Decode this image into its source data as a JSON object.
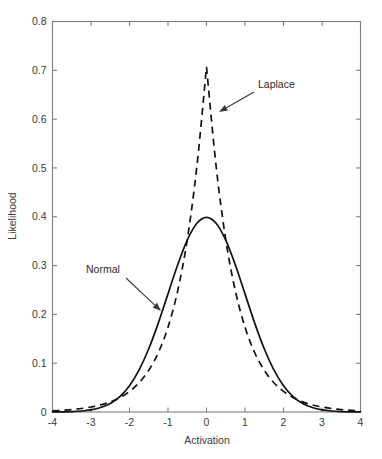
{
  "chart_data": {
    "type": "line",
    "title": "",
    "xlabel": "Activation",
    "ylabel": "Likelihood",
    "xlim": [
      -4,
      4
    ],
    "ylim": [
      0,
      0.8
    ],
    "xticks": [
      "-4",
      "-3",
      "-2",
      "-1",
      "0",
      "1",
      "2",
      "3",
      "4"
    ],
    "xtick_values": [
      -4,
      -3,
      -2,
      -1,
      0,
      1,
      2,
      3,
      4
    ],
    "yticks": [
      "0",
      "0.1",
      "0.2",
      "0.3",
      "0.4",
      "0.5",
      "0.6",
      "0.7",
      "0.8"
    ],
    "ytick_values": [
      0,
      0.1,
      0.2,
      0.3,
      0.4,
      0.5,
      0.6,
      0.7,
      0.8
    ],
    "grid": false,
    "legend_position": "inline-annotations",
    "series": [
      {
        "name": "Normal",
        "style": "solid",
        "color": "#111111",
        "description": "Standard normal density, mean 0, sd 1",
        "x": [
          -4,
          -3.75,
          -3.5,
          -3.25,
          -3,
          -2.75,
          -2.5,
          -2.25,
          -2,
          -1.75,
          -1.5,
          -1.25,
          -1,
          -0.75,
          -0.5,
          -0.25,
          0,
          0.25,
          0.5,
          0.75,
          1,
          1.25,
          1.5,
          1.75,
          2,
          2.25,
          2.5,
          2.75,
          3,
          3.25,
          3.5,
          3.75,
          4
        ],
        "values": [
          0.0001,
          0.0004,
          0.0009,
          0.002,
          0.0044,
          0.0091,
          0.0175,
          0.0317,
          0.054,
          0.0863,
          0.1295,
          0.1826,
          0.242,
          0.3011,
          0.3521,
          0.3867,
          0.3989,
          0.3867,
          0.3521,
          0.3011,
          0.242,
          0.1826,
          0.1295,
          0.0863,
          0.054,
          0.0317,
          0.0175,
          0.0091,
          0.0044,
          0.002,
          0.0009,
          0.0004,
          0.0001
        ]
      },
      {
        "name": "Laplace",
        "style": "dashed",
        "color": "#111111",
        "description": "Laplace density, location 0, scale 1/sqrt(2), peak 0.7071",
        "x": [
          -4,
          -3.75,
          -3.5,
          -3.25,
          -3,
          -2.75,
          -2.5,
          -2.25,
          -2,
          -1.75,
          -1.5,
          -1.25,
          -1,
          -0.75,
          -0.5,
          -0.25,
          0,
          0.25,
          0.5,
          0.75,
          1,
          1.25,
          1.5,
          1.75,
          2,
          2.25,
          2.5,
          2.75,
          3,
          3.25,
          3.5,
          3.75,
          4
        ],
        "values": [
          0.0024,
          0.0035,
          0.005,
          0.0071,
          0.0102,
          0.0145,
          0.0207,
          0.0295,
          0.0421,
          0.06,
          0.0855,
          0.1219,
          0.1738,
          0.2477,
          0.3531,
          0.5033,
          0.7071,
          0.5033,
          0.3531,
          0.2477,
          0.1738,
          0.1219,
          0.0855,
          0.06,
          0.0421,
          0.0295,
          0.0207,
          0.0145,
          0.0102,
          0.0071,
          0.005,
          0.0035,
          0.0024
        ]
      }
    ],
    "annotations": [
      {
        "label": "Laplace",
        "text_x": 258,
        "text_y": 88,
        "arrow_from_x": 254,
        "arrow_from_y": 92,
        "arrow_to_x": 219,
        "arrow_to_y": 112
      },
      {
        "label": "Normal",
        "text_x": 86,
        "text_y": 273,
        "arrow_from_x": 126,
        "arrow_from_y": 278,
        "arrow_to_x": 161,
        "arrow_to_y": 311
      }
    ]
  }
}
